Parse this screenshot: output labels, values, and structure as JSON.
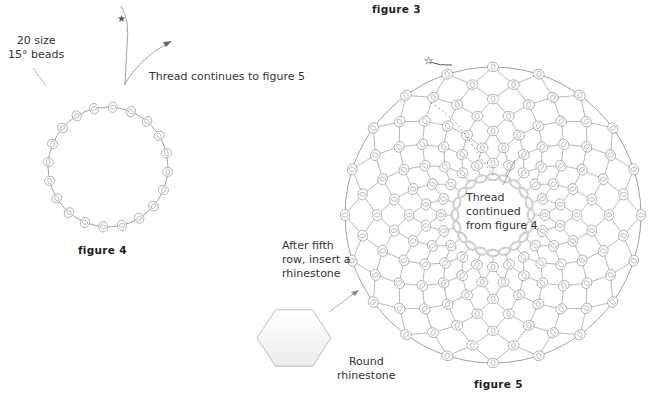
{
  "captions": {
    "figure3": "figure 3",
    "figure4": "figure 4",
    "figure5": "figure 5"
  },
  "figure4": {
    "bead_label": "20 size\n15° beads",
    "thread_label": "Thread continues to figure 5",
    "bead_count": 20,
    "center": [
      108,
      167
    ],
    "radius": 60
  },
  "figure5": {
    "center_label": "Thread\ncontinued\nfrom figure 4",
    "insert_label": "After fifth\nrow, insert a\nrhinestone",
    "rhinestone_label": "Round\nrhinestone",
    "center": [
      493,
      215
    ],
    "outer_radius": 148,
    "inner_radius": 38,
    "spokes": 20,
    "rows": 7
  },
  "colors": {
    "line": "#8a8a8a",
    "bead": "#9a9a9a",
    "inner_bead": "#cfcfcf",
    "text": "#333333"
  }
}
